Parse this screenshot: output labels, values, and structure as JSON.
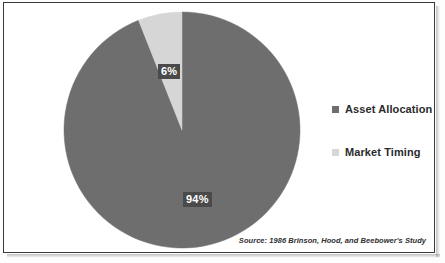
{
  "chart_data": {
    "type": "pie",
    "title": "",
    "categories": [
      "Asset Allocation",
      "Market Timing"
    ],
    "values": [
      94,
      6
    ],
    "value_labels": [
      "94%",
      "6%"
    ],
    "unit": "percent",
    "total": 100,
    "colors": [
      "#6e6e6e",
      "#d6d6d6"
    ],
    "legend_position": "right",
    "grid": false,
    "start_angle_deg": 0,
    "direction": "clockwise",
    "slices": [
      {
        "name": "Asset Allocation",
        "value": 94,
        "label": "94%",
        "color": "#6e6e6e"
      },
      {
        "name": "Market Timing",
        "value": 6,
        "label": "6%",
        "color": "#d6d6d6"
      }
    ],
    "annotations": [
      "Source: 1986 Brinson, Hood, and Beebower's Study"
    ]
  },
  "legend": {
    "items": [
      {
        "label": "Asset Allocation",
        "color": "#6e6e6e"
      },
      {
        "label": "Market Timing",
        "color": "#d6d6d6"
      }
    ]
  },
  "labels": {
    "small_slice": "6%",
    "large_slice": "94%"
  },
  "footer": {
    "source": "Source: 1986 Brinson, Hood, and Beebower's Study"
  },
  "style": {
    "frame_border": "#3a3a3a",
    "background": "#ffffff",
    "label_box": "#4a4a4a",
    "label_text": "#ffffff",
    "legend_text": "#2b2b2b"
  }
}
